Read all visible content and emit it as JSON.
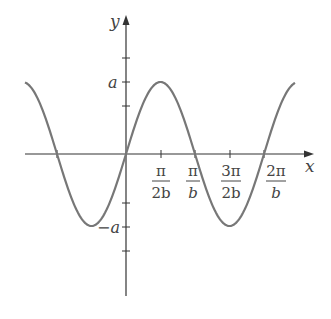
{
  "chart_data": {
    "type": "line",
    "title": "",
    "function": "y = a sin(bx)",
    "xlabel": "x",
    "ylabel": "y",
    "x_ticks": [
      {
        "num": "π",
        "den": "2b",
        "value": 0.5
      },
      {
        "num": "π",
        "den": "b",
        "value": 1.0
      },
      {
        "num": "3π",
        "den": "2b",
        "value": 1.5
      },
      {
        "num": "2π",
        "den": "b",
        "value": 2.0
      }
    ],
    "y_ticks": [
      {
        "label": "a",
        "value": 1
      },
      {
        "label": "−a",
        "value": -1
      }
    ],
    "x_range_periods": [
      -1.464,
      2.449
    ],
    "amplitude": 1,
    "series": [
      {
        "name": "a sin(bx)",
        "color": "#777777"
      }
    ],
    "grid": false,
    "legend": "none"
  },
  "axes": {
    "x_label": "x",
    "y_label": "y",
    "color": "#333333"
  }
}
